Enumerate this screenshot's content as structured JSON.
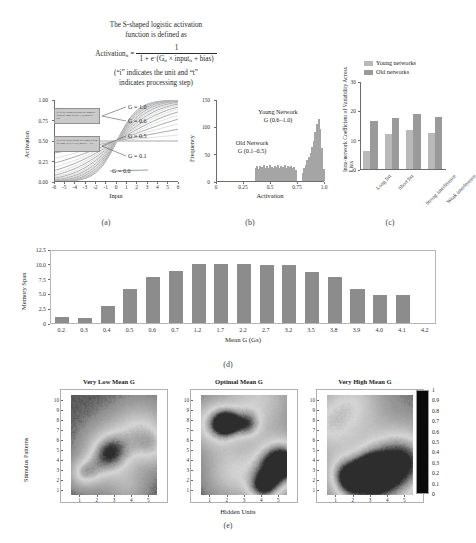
{
  "figure": {
    "equation": {
      "line1": "The S-shaped logistic activation",
      "line2": "function is defined as",
      "lhs": "Activation",
      "lhs_sub": "it",
      "equals": "=",
      "numerator": "1",
      "denominator_pre": "1 + e",
      "denominator_exp": "−",
      "denominator_post": "(G",
      "denominator_sub": "it",
      "denominator_tail": " × input",
      "denominator_sub2": "it",
      "denominator_end": " + bias)",
      "note1": "(“i” indicates the unit and “t”",
      "note2": "indicates processing step)"
    },
    "panel_labels": {
      "a": "(a)",
      "b": "(b)",
      "c": "(c)",
      "d": "(d)",
      "e": "(e)"
    }
  },
  "chart_data": [
    {
      "id": "panel_a",
      "type": "line",
      "title": "",
      "xlabel": "Input",
      "ylabel": "Activation",
      "xlim": [
        -6,
        6
      ],
      "ylim": [
        0,
        1
      ],
      "xticks": [
        "-6",
        "-5",
        "-4",
        "-3",
        "-2",
        "-1",
        "0",
        "1",
        "2",
        "3",
        "4",
        "5",
        "6"
      ],
      "yticks": [
        "0.00",
        "0.25",
        "0.50",
        "0.75",
        "1.00"
      ],
      "grid": false,
      "curve_gains": [
        0.0,
        0.1,
        0.2,
        0.3,
        0.4,
        0.5,
        0.6,
        0.7,
        0.8,
        0.9,
        1.0
      ],
      "annotations": [
        {
          "label": "G = 1.0",
          "gain": 1.0
        },
        {
          "label": "G = 0.6",
          "gain": 0.6
        },
        {
          "label": "G = 0.5",
          "gain": 0.5
        },
        {
          "label": "G = 0.1",
          "gain": 0.1
        },
        {
          "label": "G = 0.0",
          "gain": 0.0
        }
      ],
      "callout_boxes": [
        {
          "text": "Gs of the young networks are sampled from the range of (0.6–1.0), mean G = 0.8."
        },
        {
          "text": "Gs of the old networks are sampled from the range of (0.1–0.5), mean G = 0.3."
        }
      ]
    },
    {
      "id": "panel_b",
      "type": "histogram",
      "xlabel": "Activation",
      "ylabel": "Frequency",
      "xlim": [
        0,
        1
      ],
      "ylim": [
        0,
        150
      ],
      "xticks": [
        "0",
        "0.25",
        "0.5",
        "0.75",
        "1.0"
      ],
      "yticks": [
        "0",
        "50",
        "100",
        "150"
      ],
      "grid": false,
      "annotations": [
        {
          "line1": "Young Network",
          "line2": "G (0.6–1.0)"
        },
        {
          "line1": "Old Network",
          "line2": "G (0.1–0.5)"
        }
      ],
      "bins": [
        {
          "x": 0.355,
          "v": 24
        },
        {
          "x": 0.37,
          "v": 27
        },
        {
          "x": 0.385,
          "v": 22
        },
        {
          "x": 0.4,
          "v": 28
        },
        {
          "x": 0.415,
          "v": 25
        },
        {
          "x": 0.43,
          "v": 29
        },
        {
          "x": 0.445,
          "v": 24
        },
        {
          "x": 0.46,
          "v": 27
        },
        {
          "x": 0.475,
          "v": 23
        },
        {
          "x": 0.49,
          "v": 30
        },
        {
          "x": 0.505,
          "v": 26
        },
        {
          "x": 0.52,
          "v": 24
        },
        {
          "x": 0.535,
          "v": 28
        },
        {
          "x": 0.55,
          "v": 25
        },
        {
          "x": 0.565,
          "v": 29
        },
        {
          "x": 0.58,
          "v": 23
        },
        {
          "x": 0.595,
          "v": 27
        },
        {
          "x": 0.61,
          "v": 26
        },
        {
          "x": 0.625,
          "v": 30
        },
        {
          "x": 0.64,
          "v": 24
        },
        {
          "x": 0.655,
          "v": 28
        },
        {
          "x": 0.67,
          "v": 25
        },
        {
          "x": 0.685,
          "v": 27
        },
        {
          "x": 0.7,
          "v": 23
        },
        {
          "x": 0.715,
          "v": 26
        },
        {
          "x": 0.73,
          "v": 20
        },
        {
          "x": 0.79,
          "v": 14
        },
        {
          "x": 0.805,
          "v": 24
        },
        {
          "x": 0.82,
          "v": 30
        },
        {
          "x": 0.835,
          "v": 38
        },
        {
          "x": 0.85,
          "v": 44
        },
        {
          "x": 0.865,
          "v": 52
        },
        {
          "x": 0.88,
          "v": 62
        },
        {
          "x": 0.895,
          "v": 74
        },
        {
          "x": 0.91,
          "v": 90
        },
        {
          "x": 0.925,
          "v": 104
        },
        {
          "x": 0.94,
          "v": 113
        },
        {
          "x": 0.955,
          "v": 96
        },
        {
          "x": 0.97,
          "v": 60
        },
        {
          "x": 0.985,
          "v": 22
        }
      ]
    },
    {
      "id": "panel_c",
      "type": "bar",
      "ylabel": "Intra-network Coefficient of Variability Across Lists",
      "xlabel": "",
      "ylim": [
        0,
        30
      ],
      "yticks": [
        "0",
        "10",
        "20",
        "30"
      ],
      "grid": false,
      "categories": [
        "Long list",
        "Short list",
        "Strong interference",
        "Weak interference"
      ],
      "legend_position": "top",
      "series": [
        {
          "name": "Young networks",
          "color": "#b9b9b9",
          "values": [
            6.2,
            12.0,
            13.4,
            12.4
          ]
        },
        {
          "name": "Old networks",
          "color": "#9a9a9a",
          "values": [
            16.2,
            17.3,
            18.9,
            17.6
          ]
        }
      ]
    },
    {
      "id": "panel_d",
      "type": "bar",
      "xlabel": "Mean G (Gs)",
      "ylabel": "Memory Span",
      "ylim": [
        0,
        12.5
      ],
      "yticks": [
        "0",
        "2.5",
        "5.0",
        "7.5",
        "10.0",
        "12.5"
      ],
      "grid": false,
      "categories": [
        "0.2",
        "0.3",
        "0.4",
        "0.5",
        "0.6",
        "0.7",
        "1.2",
        "1.7",
        "2.2",
        "2.7",
        "3.2",
        "3.5",
        "3.8",
        "3.9",
        "4.0",
        "4.1",
        "4.2"
      ],
      "values": [
        0.95,
        0.92,
        2.9,
        5.8,
        7.85,
        8.8,
        9.95,
        9.9,
        9.9,
        9.8,
        9.85,
        8.7,
        7.7,
        5.75,
        4.75,
        4.7,
        0
      ],
      "bar_color": "#8c8c8c"
    },
    {
      "id": "panel_e",
      "type": "heatmap",
      "xlabel": "Hidden Units",
      "ylabel": "Stimulus Patterns",
      "xticks": [
        "1",
        "2",
        "3",
        "4",
        "5"
      ],
      "yticks": [
        "1",
        "2",
        "3",
        "4",
        "5",
        "6",
        "7",
        "8",
        "9",
        "10"
      ],
      "colorbar": {
        "ticks": [
          "0",
          "0.1",
          "0.2",
          "0.3",
          "0.4",
          "0.5",
          "0.6",
          "0.7",
          "0.8",
          "0.9",
          "1"
        ],
        "min": 0,
        "max": 1
      },
      "maps": [
        {
          "title": "Very Low Mean G",
          "seed": 11,
          "contrast": 0.42,
          "base": 0.22
        },
        {
          "title": "Optimal Mean G",
          "seed": 27,
          "contrast": 0.78,
          "base": 0.18
        },
        {
          "title": "Very High Mean G",
          "seed": 43,
          "contrast": 0.55,
          "base": 0.25
        }
      ]
    }
  ]
}
